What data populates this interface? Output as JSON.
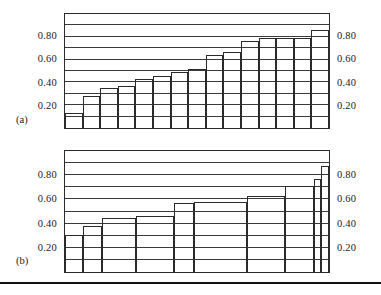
{
  "figure": {
    "background_color": "#ffffff",
    "line_color": "#2b2b2b",
    "grid_color": "#3a3a3a",
    "rule_color": "#111111"
  },
  "panels": [
    {
      "letter": "(a)",
      "tick_labels_left": [
        "0.80",
        "0.60",
        "0.40",
        "0.20"
      ],
      "tick_labels_right": [
        "0.80",
        "0.60",
        "0.40",
        "0.20"
      ]
    },
    {
      "letter": "(b)",
      "tick_labels_left": [
        "0.80",
        "0.60",
        "0.40",
        "0.20"
      ],
      "tick_labels_right": [
        "0.80",
        "0.60",
        "0.40",
        "0.20"
      ]
    }
  ],
  "chart_data": [
    {
      "type": "bar",
      "panel": "(a)",
      "title": "",
      "xlabel": "",
      "ylabel": "",
      "ylim": [
        0,
        1.0
      ],
      "grid": true,
      "gridlines": [
        0.1,
        0.2,
        0.3,
        0.4,
        0.5,
        0.6,
        0.7,
        0.8,
        0.9
      ],
      "ytick_values": [
        0.2,
        0.4,
        0.6,
        0.8
      ],
      "ytick_labels": [
        "0.20",
        "0.40",
        "0.60",
        "0.80"
      ],
      "legend": null,
      "bar_widths_equal": true,
      "categories": [
        "1",
        "2",
        "3",
        "4",
        "5",
        "6",
        "7",
        "8",
        "9",
        "10",
        "11",
        "12",
        "13",
        "14",
        "15"
      ],
      "values": [
        0.13,
        0.28,
        0.35,
        0.37,
        0.43,
        0.46,
        0.49,
        0.52,
        0.64,
        0.67,
        0.76,
        0.79,
        0.79,
        0.79,
        0.86
      ]
    },
    {
      "type": "bar",
      "panel": "(b)",
      "title": "",
      "xlabel": "",
      "ylabel": "",
      "ylim": [
        0,
        1.0
      ],
      "grid": true,
      "gridlines": [
        0.1,
        0.2,
        0.3,
        0.4,
        0.5,
        0.6,
        0.7,
        0.8,
        0.9
      ],
      "ytick_values": [
        0.2,
        0.4,
        0.6,
        0.8
      ],
      "ytick_labels": [
        "0.20",
        "0.40",
        "0.60",
        "0.80"
      ],
      "legend": null,
      "bar_widths_equal": false,
      "categories": [
        "1",
        "2",
        "3",
        "4",
        "5",
        "6",
        "7",
        "8",
        "9"
      ],
      "values": [
        0.31,
        0.38,
        0.45,
        0.46,
        0.57,
        0.58,
        0.63,
        0.71,
        0.77
      ],
      "bar_widths_fraction": [
        0.068,
        0.068,
        0.125,
        0.143,
        0.072,
        0.195,
        0.143,
        0.105,
        0.028
      ],
      "extra_narrow_bar": {
        "value": 0.88,
        "width_fraction": 0.028
      }
    }
  ]
}
